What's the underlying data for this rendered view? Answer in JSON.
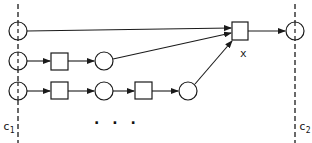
{
  "diagram": {
    "type": "petri-net-like flow diagram",
    "stroke_color": "#1a1a1a",
    "background": "#ffffff",
    "cuts": [
      {
        "id": "c1",
        "label": "c",
        "subscript": "1",
        "x": 18
      },
      {
        "id": "c2",
        "label": "c",
        "subscript": "2",
        "x": 295
      }
    ],
    "rows": [
      {
        "y": 31,
        "nodes": [
          {
            "kind": "circle",
            "x": 18
          }
        ]
      },
      {
        "y": 61,
        "nodes": [
          {
            "kind": "circle",
            "x": 18
          },
          {
            "kind": "square",
            "x": 57
          },
          {
            "kind": "circle",
            "x": 104
          }
        ]
      },
      {
        "y": 91,
        "nodes": [
          {
            "kind": "circle",
            "x": 18
          },
          {
            "kind": "square",
            "x": 57
          },
          {
            "kind": "circle",
            "x": 104
          },
          {
            "kind": "square",
            "x": 149
          },
          {
            "kind": "circle",
            "x": 188
          }
        ]
      }
    ],
    "join_node": {
      "kind": "square",
      "label": "x",
      "x": 240,
      "y": 30
    },
    "output_node": {
      "kind": "circle",
      "x": 295,
      "y": 31
    },
    "ellipsis": "• • •"
  },
  "labels": {
    "c1_main": "c",
    "c1_sub": "1",
    "c2_main": "c",
    "c2_sub": "2",
    "x_label": "x",
    "ellipsis": "· · ·"
  }
}
